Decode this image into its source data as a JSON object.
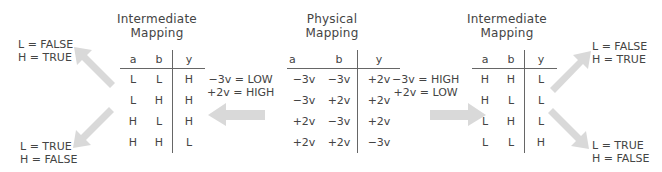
{
  "left_table": {
    "title_line1": "Intermediate",
    "title_line2": "Mapping",
    "headers": [
      "a",
      "b",
      "y"
    ],
    "rows": [
      [
        "L",
        "L",
        "H"
      ],
      [
        "L",
        "H",
        "H"
      ],
      [
        "H",
        "L",
        "H"
      ],
      [
        "H",
        "H",
        "L"
      ]
    ]
  },
  "center_table": {
    "title_line1": "Physical",
    "title_line2": "Mapping",
    "headers": [
      "a",
      "b",
      "y"
    ],
    "rows": [
      [
        "−3v",
        "−3v",
        "+2v"
      ],
      [
        "−3v",
        "+2v",
        "+2v"
      ],
      [
        "+2v",
        "−3v",
        "+2v"
      ],
      [
        "+2v",
        "+2v",
        "−3v"
      ]
    ]
  },
  "right_table": {
    "title_line1": "Intermediate",
    "title_line2": "Mapping",
    "headers": [
      "a",
      "b",
      "y"
    ],
    "rows": [
      [
        "H",
        "H",
        "L"
      ],
      [
        "H",
        "L",
        "L"
      ],
      [
        "L",
        "H",
        "L"
      ],
      [
        "L",
        "L",
        "H"
      ]
    ]
  },
  "left_mapping_label": {
    "line1": "−3v = LOW",
    "line2": "+2v = HIGH"
  },
  "right_mapping_label": {
    "line1": "−3v = HIGH",
    "line2": "+2v = LOW"
  },
  "left_top_logic": {
    "line1": "L  = FALSE",
    "line2": "H = TRUE"
  },
  "left_bottom_logic": {
    "line1": "L  = TRUE",
    "line2": "H = FALSE"
  },
  "right_top_logic": {
    "line1": "L  = FALSE",
    "line2": "H = TRUE"
  },
  "right_bottom_logic": {
    "line1": "L  = TRUE",
    "line2": "H = FALSE"
  },
  "colors": {
    "arrow": "#d9d9d9",
    "text": "#444444"
  }
}
